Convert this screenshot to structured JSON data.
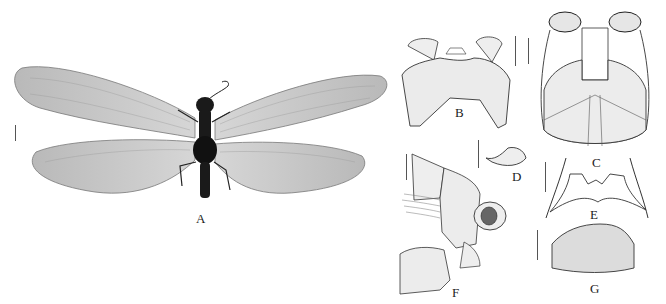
{
  "figure": {
    "panels": [
      {
        "id": "A",
        "label": "A",
        "description": "whole specimen, dorsal habitus with wings spread"
      },
      {
        "id": "B",
        "label": "B",
        "description": "head sclerite / pronotum-like plate, stippled line drawing"
      },
      {
        "id": "C",
        "label": "C",
        "description": "terminalia, ventral view"
      },
      {
        "id": "D",
        "label": "D",
        "description": "small hooked sclerite"
      },
      {
        "id": "E",
        "label": "E",
        "description": "arched sclerite with lateral arms"
      },
      {
        "id": "F",
        "label": "F",
        "description": "terminalia, lateral view"
      },
      {
        "id": "G",
        "label": "G",
        "description": "subgenital plate, stippled"
      }
    ],
    "colors": {
      "background": "#ffffff",
      "ink": "#222222",
      "wing": "#c8c8c8",
      "body": "#1a1a1a",
      "stipple": "#e6e6e6"
    }
  }
}
